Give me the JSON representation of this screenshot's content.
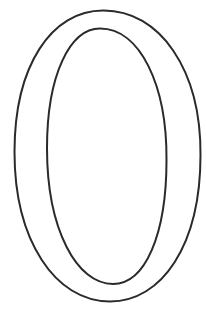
{
  "figure": {
    "glyph": "0",
    "stroke_color": "#2a2a2a",
    "background_color": "#ffffff"
  }
}
